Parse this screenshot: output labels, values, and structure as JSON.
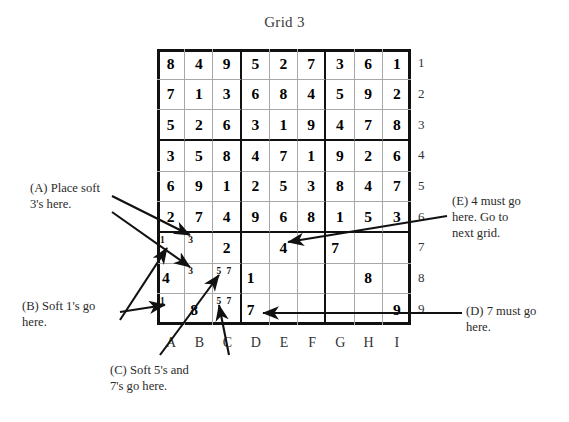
{
  "title": "Grid 3",
  "grid": {
    "columns": [
      "A",
      "B",
      "C",
      "D",
      "E",
      "F",
      "G",
      "H",
      "I"
    ],
    "rows": [
      "1",
      "2",
      "3",
      "4",
      "5",
      "6",
      "7",
      "8",
      "9"
    ],
    "given_rows": [
      [
        "8",
        "4",
        "9",
        "5",
        "2",
        "7",
        "3",
        "6",
        "1"
      ],
      [
        "7",
        "1",
        "3",
        "6",
        "8",
        "4",
        "5",
        "9",
        "2"
      ],
      [
        "5",
        "2",
        "6",
        "3",
        "1",
        "9",
        "4",
        "7",
        "8"
      ],
      [
        "3",
        "5",
        "8",
        "4",
        "7",
        "1",
        "9",
        "2",
        "6"
      ],
      [
        "6",
        "9",
        "1",
        "2",
        "5",
        "3",
        "8",
        "4",
        "7"
      ],
      [
        "2",
        "7",
        "4",
        "9",
        "6",
        "8",
        "1",
        "5",
        "3"
      ],
      [
        "",
        "",
        "2",
        "",
        "4",
        "",
        "7",
        "",
        ""
      ],
      [
        "4",
        "",
        "",
        "1",
        "",
        "",
        "",
        "8",
        ""
      ],
      [
        "",
        "8",
        "",
        "7",
        "",
        "",
        "",
        "",
        "9"
      ]
    ],
    "pencil_marks": {
      "r7c1": [
        "1"
      ],
      "r7c2": [
        "3"
      ],
      "r8c2": [
        "3"
      ],
      "r8c3": [
        "5",
        "7"
      ],
      "r9c1": [
        "1"
      ],
      "r9c3": [
        "5",
        "7"
      ]
    }
  },
  "callouts": {
    "a": "(A) Place soft\n3's here.",
    "b": "(B) Soft 1's go\nhere.",
    "c": "(C) Soft 5's and\n7's go here.",
    "d": "(D) 7 must go\nhere.",
    "e": "(E) 4 must go\nhere. Go to\nnext grid."
  },
  "colors": {
    "ink": "#111111",
    "grid_line": "#a8a8a8",
    "text": "#2b2b2b",
    "background": "#ffffff"
  }
}
